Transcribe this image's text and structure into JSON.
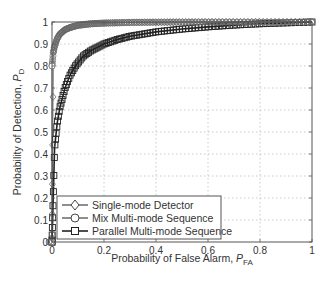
{
  "chart_data": {
    "type": "line",
    "title": "",
    "xlabel": "Probability of False Alarm, P_FA",
    "xlabel_main": "Probability of False Alarm, ",
    "xlabel_sym": "P",
    "xlabel_sub": "FA",
    "ylabel": "Probability of Detection, P_D",
    "ylabel_main": "Probability of Detection, ",
    "ylabel_sym": "P",
    "ylabel_sub": "D",
    "xlim": [
      0,
      1
    ],
    "ylim": [
      0,
      1
    ],
    "grid": true,
    "legend_position": "lower left",
    "xticks": [
      0,
      0.2,
      0.4,
      0.6,
      0.8,
      1
    ],
    "xtick_labels": [
      "0",
      "0.2",
      "0.4",
      "0.6",
      "0.8",
      "1"
    ],
    "yticks": [
      0,
      0.1,
      0.2,
      0.3,
      0.4,
      0.5,
      0.6,
      0.7,
      0.8,
      0.9,
      1
    ],
    "ytick_labels": [
      "0",
      "0.1",
      "0.2",
      "0.3",
      "0.4",
      "0.5",
      "0.6",
      "0.7",
      "0.8",
      "0.9",
      "1"
    ],
    "series": [
      {
        "name": "Single-mode Detector",
        "marker": "diamond",
        "x": [
          0,
          0.005,
          0.01,
          0.02,
          0.03,
          0.05,
          0.07,
          0.1,
          0.15,
          0.2,
          0.3,
          0.4,
          0.6,
          0.8,
          1.0
        ],
        "y": [
          0,
          0.86,
          0.89,
          0.925,
          0.945,
          0.965,
          0.975,
          0.985,
          0.992,
          0.995,
          0.998,
          0.999,
          1.0,
          1.0,
          1.0
        ]
      },
      {
        "name": "Mix Multi-mode Sequence",
        "marker": "circle",
        "x": [
          0,
          0.0,
          0.005,
          0.01,
          0.02,
          0.03,
          0.05,
          0.07,
          0.1,
          0.15,
          0.2,
          0.3,
          0.4,
          0.6,
          0.8,
          1.0
        ],
        "y": [
          0,
          0.8,
          0.86,
          0.89,
          0.925,
          0.945,
          0.965,
          0.975,
          0.985,
          0.992,
          0.995,
          0.998,
          0.999,
          1.0,
          1.0,
          1.0
        ]
      },
      {
        "name": "Parallel Multi-mode Sequence",
        "marker": "square",
        "x": [
          0,
          0.01,
          0.02,
          0.03,
          0.05,
          0.07,
          0.09,
          0.12,
          0.15,
          0.2,
          0.25,
          0.3,
          0.4,
          0.5,
          0.6,
          0.7,
          0.8,
          0.9,
          1.0
        ],
        "y": [
          0,
          0.43,
          0.54,
          0.61,
          0.7,
          0.76,
          0.8,
          0.845,
          0.87,
          0.9,
          0.92,
          0.935,
          0.955,
          0.968,
          0.978,
          0.986,
          0.992,
          0.996,
          1.0
        ]
      }
    ]
  },
  "legend": {
    "items": [
      {
        "label": "Single-mode Detector",
        "marker": "diamond-icon"
      },
      {
        "label": "Mix Multi-mode Sequence",
        "marker": "circle-icon"
      },
      {
        "label": "Parallel Multi-mode Sequence",
        "marker": "square-icon"
      }
    ]
  }
}
